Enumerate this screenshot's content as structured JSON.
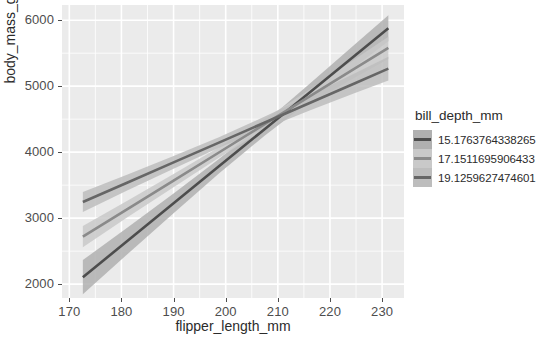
{
  "chart_data": {
    "type": "line",
    "title": "",
    "subtitle": "",
    "xlabel": "flipper_length_mm",
    "ylabel": "body_mass_g",
    "xlim": [
      168.6,
      234.2
    ],
    "ylim": [
      1790,
      6230
    ],
    "xticks": [
      170,
      180,
      190,
      200,
      210,
      220,
      230
    ],
    "xticklabels": [
      "170",
      "180",
      "190",
      "200",
      "210",
      "220",
      "230"
    ],
    "yticks": [
      2000,
      3000,
      4000,
      5000,
      6000
    ],
    "yticklabels": [
      "2000",
      "3000",
      "4000",
      "5000",
      "6000"
    ],
    "grid": true,
    "grid_color": "#ffffff",
    "panel_background": "#ebebeb",
    "legend": {
      "title": "bill_depth_mm",
      "position": "right",
      "entries": [
        {
          "label": "15.1763764338265",
          "color": "#4d4d4d",
          "ribbon_color": "#b0b0b0"
        },
        {
          "label": "17.1511695906433",
          "color": "#8a8a8a",
          "ribbon_color": "#c9c9c9"
        },
        {
          "label": "19.1259627474601",
          "color": "#666666",
          "ribbon_color": "#bdbdbd"
        }
      ]
    },
    "series": [
      {
        "name": "15.1763764338265",
        "color": "#4d4d4d",
        "ribbon_color": "#b0b0b0",
        "x": [
          172.6,
          181.3,
          190.0,
          198.7,
          207.4,
          216.1,
          224.8,
          231.2
        ],
        "y": [
          2105,
          2665,
          3225,
          3785,
          4345,
          4905,
          5465,
          5878
        ],
        "y_lower": [
          1845,
          2465,
          3075,
          3675,
          4245,
          4775,
          5295,
          5680
        ],
        "y_upper": [
          2365,
          2865,
          3375,
          3895,
          4445,
          5035,
          5635,
          6076
        ]
      },
      {
        "name": "17.1511695906433",
        "color": "#8a8a8a",
        "ribbon_color": "#c9c9c9",
        "x": [
          172.6,
          181.3,
          190.0,
          198.7,
          207.4,
          216.1,
          224.8,
          231.2
        ],
        "y": [
          2720,
          3145,
          3570,
          3995,
          4420,
          4845,
          5270,
          5580
        ],
        "y_lower": [
          2560,
          3020,
          3470,
          3915,
          4340,
          4740,
          5130,
          5410
        ],
        "y_upper": [
          2880,
          3270,
          3670,
          4075,
          4500,
          4950,
          5410,
          5750
        ]
      },
      {
        "name": "19.1259627474601",
        "color": "#666666",
        "ribbon_color": "#bdbdbd",
        "x": [
          172.6,
          181.3,
          190.0,
          198.7,
          207.4,
          216.1,
          224.8,
          231.2
        ],
        "y": [
          3245,
          3545,
          3845,
          4145,
          4445,
          4745,
          5045,
          5265
        ],
        "y_lower": [
          3095,
          3425,
          3750,
          4065,
          4355,
          4630,
          4895,
          5085
        ],
        "y_upper": [
          3395,
          3665,
          3940,
          4225,
          4535,
          4860,
          5195,
          5445
        ]
      }
    ]
  },
  "axes": {
    "x_title": "flipper_length_mm",
    "y_title": "body_mass_g"
  },
  "legend": {
    "title": "bill_depth_mm",
    "items": [
      {
        "label": "15.1763764338265"
      },
      {
        "label": "17.1511695906433"
      },
      {
        "label": "19.1259627474601"
      }
    ]
  }
}
